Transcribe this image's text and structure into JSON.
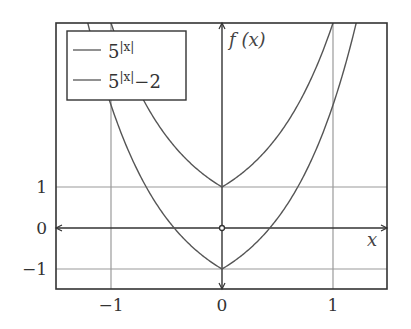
{
  "chart_data": {
    "type": "line",
    "title": "",
    "xlabel": "x",
    "ylabel": "f (x)",
    "xlim": [
      -1.5,
      1.5
    ],
    "ylim": [
      -1.5,
      5
    ],
    "xticks": [
      -1,
      0,
      1
    ],
    "xtick_labels": [
      "−1",
      "0",
      "1"
    ],
    "yticks": [
      -1,
      0,
      1
    ],
    "ytick_labels": [
      "−1",
      "0",
      "1"
    ],
    "grid": true,
    "legend_position": "upper left",
    "series": [
      {
        "name": "5^|x|",
        "legend_base": "5",
        "legend_exp": "|x|",
        "legend_suffix": "",
        "formula": "5^|x|",
        "x": [
          -1.0,
          -0.75,
          -0.5,
          -0.25,
          0,
          0.25,
          0.5,
          0.75,
          1.0
        ],
        "values": [
          5.0,
          3.34,
          2.24,
          1.5,
          1.0,
          1.5,
          2.24,
          3.34,
          5.0
        ]
      },
      {
        "name": "5^|x|−2",
        "legend_base": "5",
        "legend_exp": "|x|",
        "legend_suffix": "−2",
        "formula": "5^|x|-2",
        "x": [
          -1.18,
          -1.0,
          -0.75,
          -0.5,
          -0.25,
          0,
          0.25,
          0.5,
          0.75,
          1.0,
          1.18
        ],
        "values": [
          4.7,
          3.0,
          1.34,
          0.24,
          -0.5,
          -1.0,
          -0.5,
          0.24,
          1.34,
          3.0,
          4.7
        ]
      }
    ],
    "annotations": [
      {
        "type": "open-circle",
        "x": 0,
        "y": 0
      }
    ]
  },
  "colors": {
    "frame": "#333333",
    "axis": "#333333",
    "grid": "#9a9a9a",
    "curve": "#555555"
  }
}
